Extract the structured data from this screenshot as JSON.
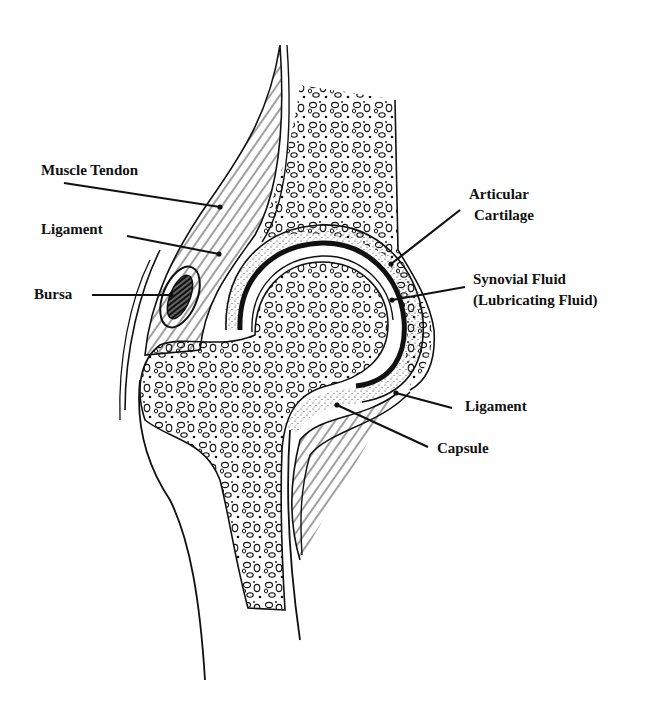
{
  "diagram": {
    "colors": {
      "ink": "#111111",
      "background": "#ffffff"
    },
    "labels": [
      {
        "id": "muscle-tendon",
        "text": "Muscle Tendon",
        "x": 41,
        "y": 160,
        "leader": [
          [
            64,
            183
          ],
          [
            220,
            207
          ]
        ]
      },
      {
        "id": "ligament-upper",
        "text": "Ligament",
        "x": 41,
        "y": 219,
        "leader": [
          [
            127,
            236
          ],
          [
            219,
            254
          ]
        ]
      },
      {
        "id": "bursa",
        "text": "Bursa",
        "x": 34,
        "y": 284,
        "leader": [
          [
            92,
            295
          ],
          [
            171,
            295
          ]
        ]
      },
      {
        "id": "articular-cartilage",
        "line1": "Articular",
        "line2": "Cartilage",
        "x": 469,
        "y": 185,
        "leader": [
          [
            460,
            210
          ],
          [
            391,
            264
          ]
        ]
      },
      {
        "id": "synovial-fluid",
        "line1": "Synovial Fluid",
        "line2": "(Lubricating Fluid)",
        "x": 473,
        "y": 270,
        "leader": [
          [
            465,
            287
          ],
          [
            392,
            300
          ]
        ]
      },
      {
        "id": "ligament-lower",
        "text": "Ligament",
        "x": 465,
        "y": 396,
        "leader": [
          [
            452,
            408
          ],
          [
            396,
            393
          ]
        ]
      },
      {
        "id": "capsule",
        "text": "Capsule",
        "x": 437,
        "y": 438,
        "leader": [
          [
            428,
            447
          ],
          [
            337,
            405
          ]
        ]
      }
    ]
  }
}
